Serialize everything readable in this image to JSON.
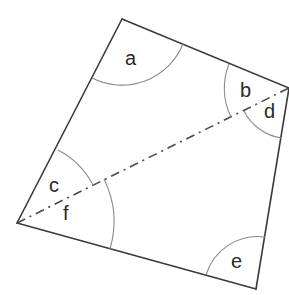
{
  "diagram": {
    "type": "quadrilateral-angles",
    "vertices": {
      "top": [
        122,
        19
      ],
      "right": [
        289,
        88
      ],
      "bottom_right": [
        256,
        289
      ],
      "left": [
        17,
        223
      ]
    },
    "diagonal": {
      "from": "left",
      "to": "right",
      "style": "dash-dot"
    },
    "angle_labels": [
      {
        "id": "a",
        "text": "a",
        "vertex": "top"
      },
      {
        "id": "b",
        "text": "b",
        "vertex": "right"
      },
      {
        "id": "d",
        "text": "d",
        "vertex": "right"
      },
      {
        "id": "c",
        "text": "c",
        "vertex": "left"
      },
      {
        "id": "f",
        "text": "f",
        "vertex": "left"
      },
      {
        "id": "e",
        "text": "e",
        "vertex": "bottom_right"
      }
    ],
    "colors": {
      "edge": "#3a3a3a",
      "arc": "#8a8a8a",
      "text": "#2a2a2a"
    }
  }
}
